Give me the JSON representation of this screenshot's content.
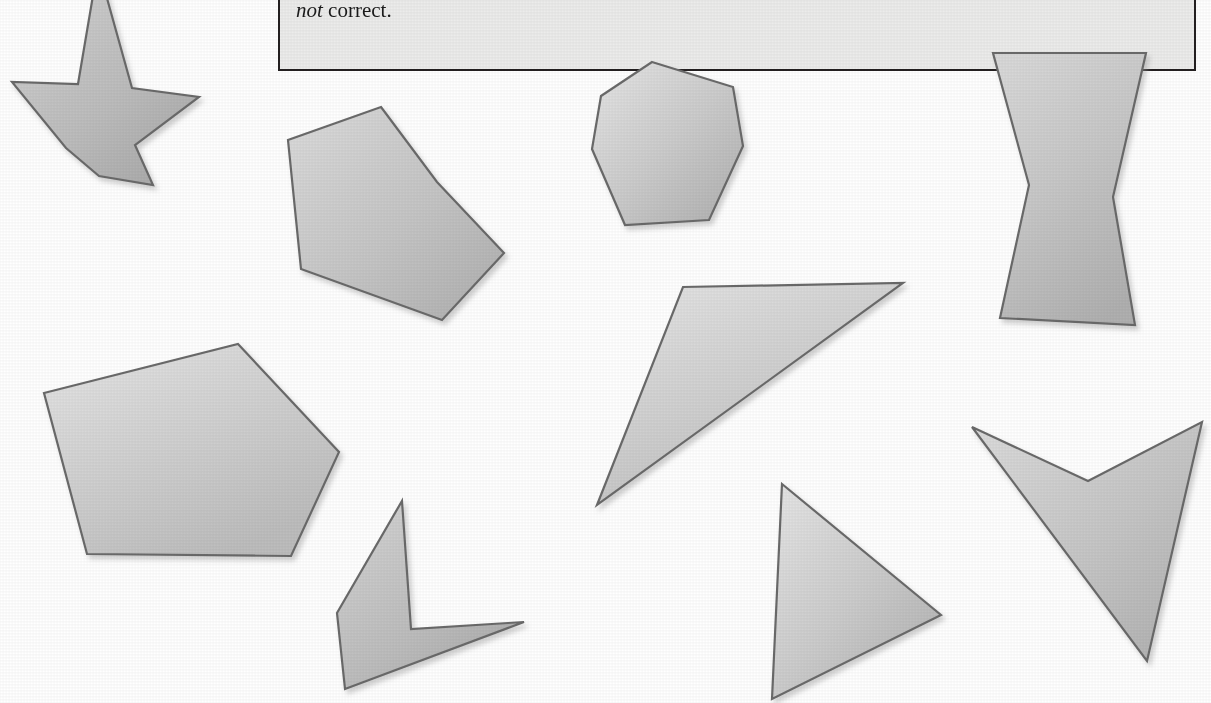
{
  "page": {
    "width": 1211,
    "height": 703,
    "background_color": "#ffffff",
    "kind": "textbook-figure-page"
  },
  "callout": {
    "background_color": "#ececeb",
    "border_color": "#231f20",
    "lines": [
      {
        "id": "line1",
        "text": "in order as you move around the quadrilateral. The name ACBD is",
        "clipped": true
      },
      {
        "id": "line2_italic",
        "text": "not"
      },
      {
        "id": "line2_rest",
        "text": " correct."
      }
    ],
    "full_text": "in order as you move around the quadrilateral. The name ACBD is not correct."
  },
  "shapes": {
    "fill_light": "#dcdcdc",
    "fill_mid": "#c4c4c4",
    "fill_dark": "#ababab",
    "stroke_color": "#6b6b6b",
    "shadow_color": "#d6d6d6",
    "items": [
      {
        "id": "four-point-star",
        "name": "four-pointed-star",
        "sides": 8,
        "convex": false,
        "clipped_top": true,
        "points": "98,-34 132,88 199,97 135,145 153,185 99,176 66,148 12,82 78,84"
      },
      {
        "id": "irregular-heptagon-left",
        "name": "irregular-heptagon",
        "sides": 7,
        "convex": false,
        "points": "381,107 437,182 504,253 442,320 301,269 288,140"
      },
      {
        "id": "heptagon-top-middle",
        "name": "regular-like-heptagon",
        "sides": 7,
        "convex": true,
        "points": "652,62 733,87 743,146 709,220 625,225 592,149 601,96"
      },
      {
        "id": "bowtie-right",
        "name": "bowtie-hexagon",
        "sides": 6,
        "convex": false,
        "clipped_top": true,
        "points": "993,53 1146,53 1113,197 1135,325 1000,318 1029,185"
      },
      {
        "id": "large-quadrilateral-left",
        "name": "large-quadrilateral",
        "sides": 4,
        "convex": true,
        "points": "44,393 238,344 339,452 291,556 87,554"
      },
      {
        "id": "thin-triangle-middle",
        "name": "thin-obtuse-triangle",
        "sides": 3,
        "convex": true,
        "points": "683,287 903,283 597,505"
      },
      {
        "id": "chevron-bottom-left",
        "name": "concave-chevron-quadrilateral",
        "sides": 4,
        "convex": false,
        "points": "402,501 411,629 524,622 345,689 337,613"
      },
      {
        "id": "triangle-bottom-middle",
        "name": "triangle",
        "sides": 3,
        "convex": true,
        "points": "782,484 941,615 772,699"
      },
      {
        "id": "dart-bottom-right",
        "name": "concave-dart-arrowhead",
        "sides": 4,
        "convex": false,
        "points": "972,427 1088,481 1202,422 1147,661"
      }
    ]
  },
  "colors": {
    "page_background": "#ffffff",
    "ink": "#1b1b1b",
    "callout_fill": "#ececeb",
    "callout_border": "#231f20",
    "shape_stroke": "#6b6b6b"
  }
}
